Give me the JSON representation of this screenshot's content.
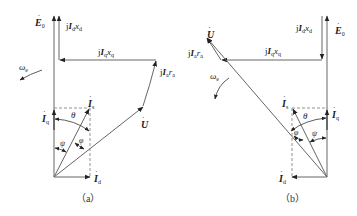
{
  "figure": {
    "panels": [
      {
        "id": "a",
        "caption": "（a）",
        "labels": {
          "E0": "E",
          "E0_sub": "0",
          "jIdxd_j": "j",
          "jIdxd_I": "I",
          "jIdxd_sub": "d",
          "jIdxd_x": "x",
          "jIdxd_xsub": "d",
          "jIqxq_j": "j",
          "jIqxq_I": "I",
          "jIqxq_sub": "q",
          "jIqxq_x": "x",
          "jIqxq_xsub": "q",
          "jIara_j": "j",
          "jIara_I": "I",
          "jIara_sub": "a",
          "jIara_r": "r",
          "jIara_rsub": "a",
          "omega": "ω",
          "omega_sub": "e",
          "U": "U",
          "Is": "I",
          "Is_sub": "s",
          "Iq": "I",
          "Iq_sub": "q",
          "Id": "I",
          "Id_sub": "d",
          "theta": "θ",
          "phi": "φ",
          "psi": "ψ"
        }
      },
      {
        "id": "b",
        "caption": "（b）",
        "labels": {
          "E0": "E",
          "E0_sub": "0",
          "jIdxd_j": "j",
          "jIdxd_I": "I",
          "jIdxd_sub": "d",
          "jIdxd_x": "x",
          "jIdxd_xsub": "d",
          "jIqxq_j": "j",
          "jIqxq_I": "I",
          "jIqxq_sub": "q",
          "jIqxq_x": "x",
          "jIqxq_xsub": "q",
          "jIara_j": "j",
          "jIara_I": "I",
          "jIara_sub": "a",
          "jIara_r": "r",
          "jIara_rsub": "a",
          "omega": "ω",
          "omega_sub": "e",
          "U": "U",
          "Is": "I",
          "Is_sub": "s",
          "Iq": "I",
          "Iq_sub": "q",
          "Id": "I",
          "Id_sub": "d",
          "theta": "θ",
          "phi": "φ",
          "psi": "ψ"
        }
      }
    ],
    "colors": {
      "line": "#555555",
      "dash": "#777777",
      "text": "#222222"
    }
  }
}
